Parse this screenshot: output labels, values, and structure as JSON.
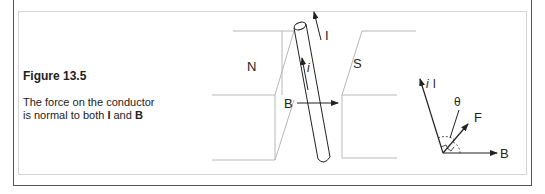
{
  "figure": {
    "title": "Figure 13.5",
    "caption_line1": "The force on the conductor",
    "caption_line2_prefix": "is normal to both ",
    "caption_I": "I",
    "caption_and": " and ",
    "caption_B": "B"
  },
  "diagram": {
    "north_pole_label": "N",
    "south_pole_label": "S",
    "current_label": "I",
    "internal_current_label": "i",
    "field_label": "B"
  },
  "vector_diagram": {
    "current_vector_label_i": "i",
    "current_vector_label_l": "l",
    "angle_label": "θ",
    "force_label": "F",
    "field_label": "B"
  },
  "colors": {
    "line": "#222222",
    "light_line": "#b8b8b8",
    "frame": "#555555"
  }
}
